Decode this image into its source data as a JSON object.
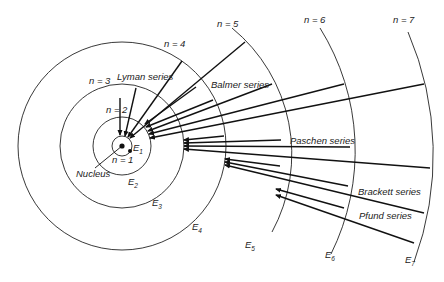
{
  "diagram": {
    "nucleus_label": "Nucleus",
    "orbit_labels": [
      "n = 1",
      "n = 2",
      "n = 3",
      "n = 4",
      "n = 5",
      "n = 6",
      "n = 7"
    ],
    "energy_labels": [
      "E1",
      "E2",
      "E3",
      "E4",
      "E5",
      "E6",
      "E7"
    ],
    "series": [
      {
        "name": "Lyman series",
        "final_n": 1
      },
      {
        "name": "Balmer series",
        "final_n": 2
      },
      {
        "name": "Paschen series",
        "final_n": 3
      },
      {
        "name": "Brackett series",
        "final_n": 4
      },
      {
        "name": "Pfund series",
        "final_n": 5
      }
    ],
    "colors": {
      "line": "#111111",
      "background": "#ffffff"
    }
  }
}
